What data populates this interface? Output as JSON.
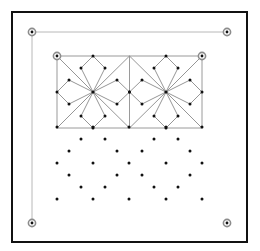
{
  "diagram": {
    "title": "",
    "colors": {
      "frame": "#111111",
      "guide": "#b8b8b8",
      "pattern": "#8a8a8a",
      "dot": "#111111",
      "anchor_ring": "#8c8c8c"
    },
    "frame": {
      "x": 12,
      "y": 12,
      "width": 235,
      "height": 230
    },
    "corner_anchors": [
      {
        "name": "top-left",
        "x": 32,
        "y": 32
      },
      {
        "name": "top-right",
        "x": 227,
        "y": 32
      },
      {
        "name": "bottom-left",
        "x": 32,
        "y": 223
      },
      {
        "name": "bottom-right",
        "x": 227,
        "y": 223
      }
    ],
    "guide_lines": [
      {
        "x1": 32,
        "y1": 32,
        "x2": 227,
        "y2": 32
      },
      {
        "x1": 32,
        "y1": 32,
        "x2": 32,
        "y2": 223
      }
    ],
    "inner_rect": {
      "x": 57,
      "y": 56,
      "width": 145,
      "height": 72,
      "divider_x": 129.5
    },
    "inner_anchors": [
      {
        "name": "inner-top-left",
        "x": 57,
        "y": 56
      },
      {
        "name": "inner-top-right",
        "x": 202,
        "y": 56
      }
    ],
    "tiles": [
      {
        "cx": 93,
        "cy": 92,
        "x0": 57,
        "x1": 129.5,
        "y0": 56,
        "y1": 128
      },
      {
        "cx": 166,
        "cy": 92,
        "x0": 129.5,
        "x1": 202,
        "y0": 56,
        "y1": 128
      }
    ],
    "petal_offsets": [
      [
        -12,
        -24
      ],
      [
        12,
        -24
      ],
      [
        -24,
        -12
      ],
      [
        -24,
        12
      ],
      [
        24,
        -12
      ],
      [
        24,
        12
      ],
      [
        -12,
        24
      ],
      [
        12,
        24
      ]
    ],
    "petal_to_edge": [
      [
        0,
        "top"
      ],
      [
        1,
        "top"
      ],
      [
        2,
        "left"
      ],
      [
        3,
        "left"
      ],
      [
        4,
        "right"
      ],
      [
        5,
        "right"
      ],
      [
        6,
        "bottom"
      ],
      [
        7,
        "bottom"
      ]
    ],
    "dot_grid": [
      [
        57,
        127
      ],
      [
        93,
        127
      ],
      [
        129,
        127
      ],
      [
        166,
        127
      ],
      [
        202,
        127
      ],
      [
        81,
        139
      ],
      [
        105,
        139
      ],
      [
        154,
        139
      ],
      [
        178,
        139
      ],
      [
        69,
        151
      ],
      [
        117,
        151
      ],
      [
        142,
        151
      ],
      [
        190,
        151
      ],
      [
        57,
        163
      ],
      [
        93,
        163
      ],
      [
        129,
        163
      ],
      [
        166,
        163
      ],
      [
        202,
        163
      ],
      [
        69,
        175
      ],
      [
        117,
        175
      ],
      [
        142,
        175
      ],
      [
        190,
        175
      ],
      [
        81,
        187
      ],
      [
        105,
        187
      ],
      [
        154,
        187
      ],
      [
        178,
        187
      ],
      [
        57,
        199
      ],
      [
        93,
        199
      ],
      [
        129,
        199
      ],
      [
        166,
        199
      ],
      [
        202,
        199
      ]
    ]
  }
}
